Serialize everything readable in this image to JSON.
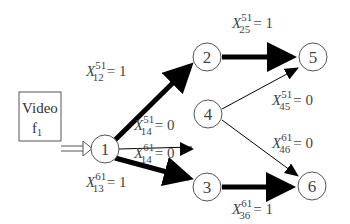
{
  "diagram": {
    "source": {
      "line1": "Video",
      "line2": "f",
      "line2_sub": "1"
    },
    "nodes": [
      {
        "id": "1",
        "label": "1",
        "x": 105,
        "y": 149
      },
      {
        "id": "2",
        "label": "2",
        "x": 207,
        "y": 57
      },
      {
        "id": "3",
        "label": "3",
        "x": 207,
        "y": 187
      },
      {
        "id": "4",
        "label": "4",
        "x": 208,
        "y": 114
      },
      {
        "id": "5",
        "label": "5",
        "x": 313,
        "y": 57
      },
      {
        "id": "6",
        "label": "6",
        "x": 312,
        "y": 186
      }
    ],
    "edges": [
      {
        "from": "1",
        "to": "2",
        "weight": "thick",
        "label": {
          "var": "X",
          "sup": "51",
          "sub": "12",
          "value": "= 1"
        }
      },
      {
        "from": "1",
        "to": "4",
        "weight": "thin",
        "label": {
          "var": "X",
          "sup": "51",
          "sub": "14",
          "value": "= 0"
        }
      },
      {
        "from": "1",
        "to": "4",
        "weight": "thin",
        "label": {
          "var": "X",
          "sup": "61",
          "sub": "14",
          "value": "= 0"
        }
      },
      {
        "from": "1",
        "to": "3",
        "weight": "thick",
        "label": {
          "var": "X",
          "sup": "61",
          "sub": "13",
          "value": "= 1"
        }
      },
      {
        "from": "2",
        "to": "5",
        "weight": "thick",
        "label": {
          "var": "X",
          "sup": "51",
          "sub": "25",
          "value": "= 1"
        }
      },
      {
        "from": "4",
        "to": "5",
        "weight": "thin",
        "label": {
          "var": "X",
          "sup": "51",
          "sub": "45",
          "value": "= 0"
        }
      },
      {
        "from": "4",
        "to": "6",
        "weight": "thin",
        "label": {
          "var": "X",
          "sup": "61",
          "sub": "46",
          "value": "= 0"
        }
      },
      {
        "from": "3",
        "to": "6",
        "weight": "thick",
        "label": {
          "var": "X",
          "sup": "61",
          "sub": "36",
          "value": "= 1"
        }
      }
    ]
  }
}
